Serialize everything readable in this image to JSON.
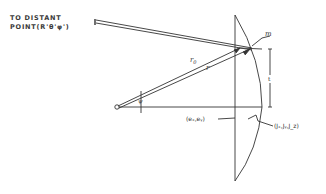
{
  "diagram": {
    "caption": {
      "line1": "TO DISTANT",
      "line2": "POINT(R'θ'φ')"
    },
    "labels": {
      "m_vector": "m",
      "r0_vector": "r",
      "r0_subscript": "0",
      "r_vector": "r",
      "psi": "ψ",
      "t_dimension": "t",
      "aperture_point": "(eₓ,eᵧ)",
      "surface_point": "(Jₓ,Jᵧ,J_z)"
    },
    "colors": {
      "line": "#333333",
      "background": "#ffffff"
    }
  }
}
